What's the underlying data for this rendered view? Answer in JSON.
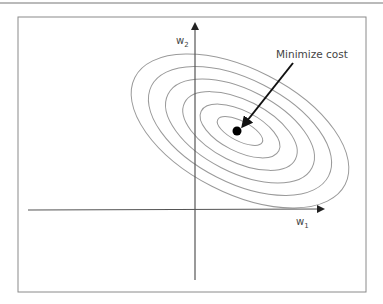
{
  "diagram": {
    "x_axis_label": "w",
    "x_axis_subscript": "1",
    "y_axis_label": "w",
    "y_axis_subscript": "2",
    "annotation": "Minimize cost",
    "contour_count": 6,
    "colors": {
      "frame": "#8a8a8a",
      "axes": "#555555",
      "contours": "#9a9a9a",
      "minimum_point": "#000000",
      "arrow": "#111111"
    }
  }
}
